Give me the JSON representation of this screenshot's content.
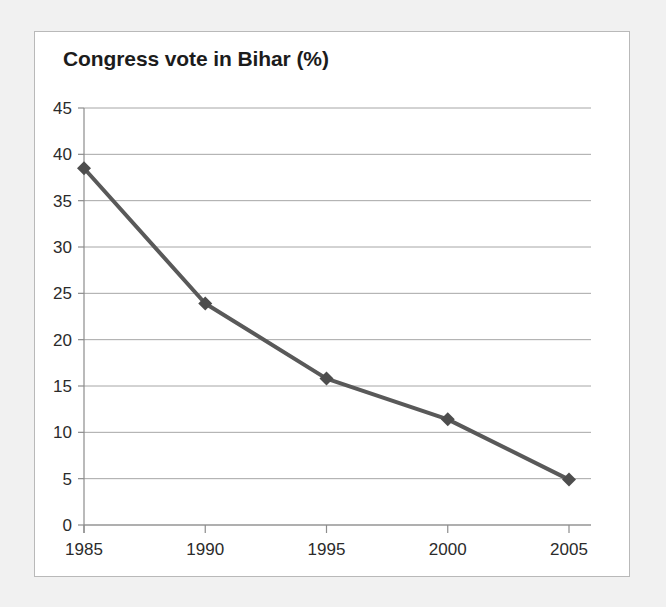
{
  "chart_data": {
    "type": "line",
    "title": "Congress vote in Bihar (%)",
    "xlabel": "",
    "ylabel": "",
    "x": [
      1985,
      1990,
      1995,
      2000,
      2005
    ],
    "categories": [
      "1985",
      "1990",
      "1995",
      "2000",
      "2005"
    ],
    "values": [
      38.5,
      23.9,
      15.8,
      11.4,
      4.9
    ],
    "series": [
      {
        "name": "Congress vote in Bihar (%)",
        "values": [
          38.5,
          23.9,
          15.8,
          11.4,
          4.9
        ]
      }
    ],
    "ylim": [
      0,
      45
    ],
    "ytick_labels": [
      "0",
      "5",
      "10",
      "15",
      "20",
      "25",
      "30",
      "35",
      "40",
      "45"
    ],
    "yticks": [
      0,
      5,
      10,
      15,
      20,
      25,
      30,
      35,
      40,
      45
    ],
    "xtick_labels": [
      "1985",
      "1990",
      "1995",
      "2000",
      "2005"
    ],
    "grid": "horizontal",
    "legend": "none",
    "marker": "diamond",
    "line_color": "#595959",
    "marker_color": "#4d4d4d",
    "grid_color": "#a6a6a6",
    "axis_color": "#8c8c8c",
    "plot_background": "#ffffff",
    "page_background": "#f1f1f1",
    "title_color": "#1c1c1c",
    "annotations": []
  }
}
